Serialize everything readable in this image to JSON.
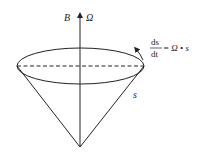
{
  "diagram": {
    "labels": {
      "field": "B",
      "angular_velocity": "Ω",
      "vector": "s",
      "equation_numerator": "ds",
      "equation_denominator": "dt",
      "equation_rhs": "= Ω • s"
    },
    "colors": {
      "stroke": "#222222",
      "background": "#ffffff"
    }
  }
}
